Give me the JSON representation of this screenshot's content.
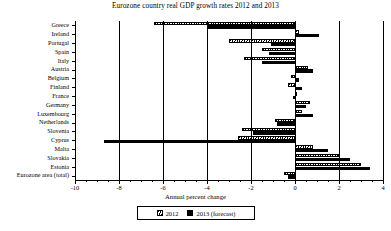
{
  "chart_data": {
    "type": "bar",
    "orientation": "horizontal",
    "title": "Eurozone country real GDP growth rates 2012 and 2013",
    "xlabel": "Annual percent change",
    "ylabel": "",
    "xlim": [
      -10,
      4
    ],
    "xticks": [
      -10,
      -8,
      -6,
      -4,
      -2,
      0,
      2,
      4
    ],
    "xticklabels": [
      "-10",
      "-8",
      "-6",
      "-4",
      "-2",
      "0",
      "2",
      "4"
    ],
    "grid": true,
    "legend_position": "bottom",
    "categories": [
      "Greece",
      "Ireland",
      "Portugal",
      "Spain",
      "Italy",
      "Austria",
      "Belgium",
      "Finland",
      "France",
      "Germany",
      "Luxembourg",
      "Netherlands",
      "Slovenia",
      "Cyprus",
      "Malta",
      "Slovakia",
      "Estonia",
      "Eurozone area (total)"
    ],
    "series": [
      {
        "name": "2012",
        "style": "hatched",
        "values": [
          -6.4,
          0.2,
          -3.0,
          -1.5,
          -2.3,
          0.6,
          -0.2,
          -0.3,
          0.1,
          0.7,
          0.3,
          -0.9,
          -2.4,
          -2.6,
          0.8,
          2.0,
          3.0,
          -0.5
        ]
      },
      {
        "name": "2013 (forecast)",
        "style": "solid",
        "values": [
          -4.0,
          1.1,
          -1.1,
          -1.2,
          -1.5,
          0.8,
          0.2,
          0.3,
          -0.1,
          0.5,
          0.8,
          -0.8,
          -1.9,
          -8.7,
          1.5,
          2.5,
          3.4,
          -0.3
        ]
      }
    ]
  },
  "legend": {
    "entries": [
      {
        "label": "2012"
      },
      {
        "label": "2013 (forecast)"
      }
    ]
  },
  "colors": {
    "axis": "#000000",
    "series_2012": "#ffffff",
    "series_2013": "#000000",
    "background": "#ffffff"
  }
}
